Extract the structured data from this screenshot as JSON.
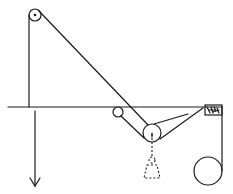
{
  "diagram": {
    "type": "pulley-system",
    "colors": {
      "stroke": "#1a1a1a",
      "background": "#ffffff"
    },
    "elements": {
      "top_pulley": {
        "cx": 35,
        "cy": 15,
        "r": 6
      },
      "table_edge": {
        "y": 107,
        "x1": 8,
        "x2": 222
      },
      "small_pulley": {
        "cx": 118,
        "cy": 111,
        "r": 5
      },
      "moving_pulley": {
        "cx": 152,
        "cy": 133,
        "r": 9
      },
      "hanging_weight_dashed": true,
      "right_pulley": {
        "cx": 207,
        "cy": 171,
        "r": 14
      },
      "clamp_block": {
        "x": 204,
        "y": 104,
        "w": 18,
        "h": 10
      },
      "force_arrow": {
        "x": 35,
        "y1": 107,
        "y2": 186,
        "direction": "down"
      }
    }
  }
}
